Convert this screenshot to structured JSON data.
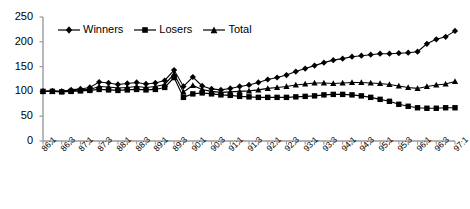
{
  "chart_data": {
    "type": "line",
    "title": "",
    "subtitle": "",
    "xlabel": "",
    "ylabel": "",
    "ylim": [
      0,
      250
    ],
    "ytick_values": [
      0,
      50,
      100,
      150,
      200,
      250
    ],
    "ytick_labels": [
      "0",
      "50",
      "100",
      "150",
      "200",
      "250"
    ],
    "grid": false,
    "legend_position": "top-left-inside",
    "x": [
      "86:1",
      "86:2",
      "86:3",
      "86:4",
      "87:1",
      "87:2",
      "87:3",
      "87:4",
      "88:1",
      "88:2",
      "88:3",
      "88:4",
      "89:1",
      "89:2",
      "89:3",
      "89:4",
      "90:1",
      "90:2",
      "90:3",
      "90:4",
      "91:1",
      "91:2",
      "91:3",
      "91:4",
      "92:1",
      "92:2",
      "92:3",
      "92:4",
      "93:1",
      "93:2",
      "93:3",
      "93:4",
      "94:1",
      "94:2",
      "94:3",
      "94:4",
      "95:1",
      "95:2",
      "95:3",
      "95:4",
      "96:1",
      "96:2",
      "96:3",
      "96:4",
      "97:1"
    ],
    "xtick_labels": [
      "86:1",
      "86:3",
      "87:1",
      "87:3",
      "88:1",
      "88:3",
      "89:1",
      "89:3",
      "90:1",
      "90:3",
      "91:1",
      "91:3",
      "92:1",
      "92:3",
      "93:1",
      "93:3",
      "94:1",
      "94:3",
      "95:1",
      "95:3",
      "96:1",
      "96:3",
      "97:1"
    ],
    "xtick_label_every": 2,
    "series": [
      {
        "name": "Winners",
        "marker": "diamond",
        "color": "#000000",
        "values": [
          100,
          101,
          100,
          103,
          105,
          108,
          119,
          117,
          114,
          116,
          118,
          115,
          117,
          122,
          143,
          110,
          129,
          111,
          105,
          103,
          106,
          110,
          113,
          118,
          124,
          128,
          133,
          140,
          146,
          152,
          158,
          163,
          166,
          170,
          172,
          174,
          176,
          176,
          177,
          178,
          180,
          196,
          205,
          210,
          222
        ]
      },
      {
        "name": "Losers",
        "marker": "square",
        "color": "#000000",
        "values": [
          100,
          100,
          99,
          100,
          101,
          102,
          104,
          103,
          102,
          103,
          104,
          103,
          104,
          108,
          128,
          88,
          95,
          97,
          95,
          93,
          92,
          90,
          89,
          88,
          88,
          88,
          88,
          89,
          90,
          91,
          93,
          94,
          94,
          93,
          91,
          88,
          84,
          80,
          74,
          70,
          67,
          66,
          66,
          67,
          67
        ]
      },
      {
        "name": "Total",
        "marker": "triangle",
        "color": "#000000",
        "values": [
          100,
          100,
          100,
          101,
          103,
          104,
          110,
          109,
          107,
          108,
          110,
          108,
          110,
          114,
          135,
          99,
          112,
          104,
          100,
          98,
          99,
          100,
          101,
          103,
          106,
          108,
          110,
          113,
          115,
          117,
          117,
          116,
          117,
          118,
          118,
          117,
          116,
          114,
          111,
          108,
          106,
          110,
          113,
          115,
          120
        ]
      }
    ]
  }
}
